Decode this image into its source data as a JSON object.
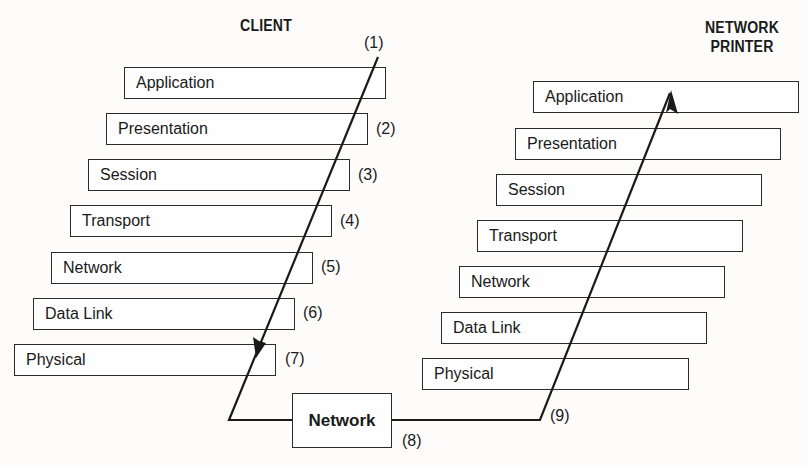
{
  "client": {
    "title": "CLIENT",
    "layers": [
      {
        "label": "Application"
      },
      {
        "label": "Presentation"
      },
      {
        "label": "Session"
      },
      {
        "label": "Transport"
      },
      {
        "label": "Network"
      },
      {
        "label": "Data Link"
      },
      {
        "label": "Physical"
      }
    ]
  },
  "printer": {
    "title_line1": "NETWORK",
    "title_line2": "PRINTER",
    "layers": [
      {
        "label": "Application"
      },
      {
        "label": "Presentation"
      },
      {
        "label": "Session"
      },
      {
        "label": "Transport"
      },
      {
        "label": "Network"
      },
      {
        "label": "Data Link"
      },
      {
        "label": "Physical"
      }
    ]
  },
  "network_box": {
    "label": "Network"
  },
  "steps": [
    "(1)",
    "(2)",
    "(3)",
    "(4)",
    "(5)",
    "(6)",
    "(7)",
    "(8)",
    "(9)"
  ],
  "colors": {
    "line": "#1a1a1a",
    "background": "#fdfcfb"
  }
}
